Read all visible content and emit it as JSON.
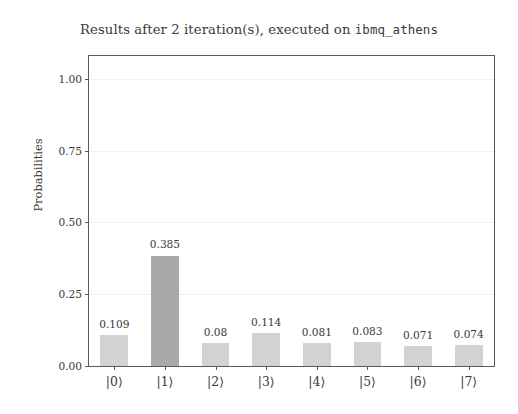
{
  "chart_data": {
    "type": "bar",
    "title": "Results after 2 iteration(s), executed on ibmq_athens",
    "title_plain_prefix": "Results after 2 iteration(s), executed on ",
    "title_mono_suffix": "ibmq_athens",
    "xlabel": "",
    "ylabel": "Probabilities",
    "categories": [
      "|0⟩",
      "|1⟩",
      "|2⟩",
      "|3⟩",
      "|4⟩",
      "|5⟩",
      "|6⟩",
      "|7⟩"
    ],
    "values": [
      0.109,
      0.385,
      0.08,
      0.114,
      0.081,
      0.083,
      0.071,
      0.074
    ],
    "value_labels": [
      "0.109",
      "0.385",
      "0.08",
      "0.114",
      "0.081",
      "0.083",
      "0.071",
      "0.074"
    ],
    "ylim": [
      0.0,
      1.08
    ],
    "yticks": [
      0.0,
      0.25,
      0.5,
      0.75,
      1.0
    ],
    "ytick_labels": [
      "0.00",
      "0.25",
      "0.50",
      "0.75",
      "1.00"
    ],
    "grid": true,
    "grid_axis": "y",
    "legend": false,
    "bar_color": "#d2d2d2",
    "highlight_color": "#a9a9a9",
    "highlight_index": 1,
    "axis_color": "#5a5a5a",
    "text_color": "#3a3a3a",
    "background": "#ffffff"
  }
}
